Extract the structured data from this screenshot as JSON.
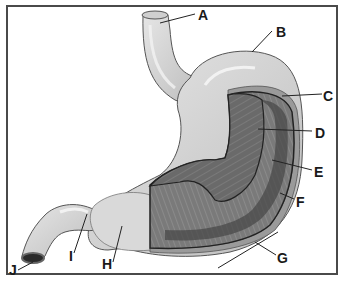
{
  "diagram": {
    "labels": [
      {
        "id": "A",
        "text": "A",
        "x": 198,
        "y": 8
      },
      {
        "id": "B",
        "text": "B",
        "x": 276,
        "y": 25
      },
      {
        "id": "C",
        "text": "C",
        "x": 323,
        "y": 89
      },
      {
        "id": "D",
        "text": "D",
        "x": 315,
        "y": 126
      },
      {
        "id": "E",
        "text": "E",
        "x": 314,
        "y": 165
      },
      {
        "id": "F",
        "text": "F",
        "x": 296,
        "y": 195
      },
      {
        "id": "G",
        "text": "G",
        "x": 277,
        "y": 251
      },
      {
        "id": "H",
        "text": "H",
        "x": 102,
        "y": 257
      },
      {
        "id": "I",
        "text": "I",
        "x": 69,
        "y": 249
      },
      {
        "id": "J",
        "text": "J",
        "x": 9,
        "y": 263
      }
    ]
  },
  "colors": {
    "border": "#4a4a4a",
    "organ_fill": "#d4d4d4",
    "organ_highlight": "#ececec",
    "muscle": "#6e6e6e",
    "muscle_dark": "#3c3c3c",
    "label": "#1a1a1a"
  }
}
